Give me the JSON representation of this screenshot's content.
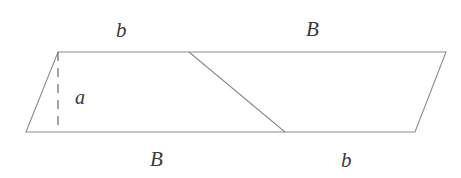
{
  "figure": {
    "type": "geometry-diagram",
    "background_color": "#ffffff",
    "stroke_color": "#8c8c8c",
    "dashed_stroke_color": "#7d7d7d",
    "label_color": "#3a3a3a",
    "canvas": {
      "width": 461,
      "height": 178
    },
    "shape": {
      "name": "parallelogram",
      "vertices": {
        "top_left": {
          "x": 58,
          "y": 52
        },
        "top_right": {
          "x": 446,
          "y": 52
        },
        "bottom_right": {
          "x": 415,
          "y": 132
        },
        "bottom_left": {
          "x": 26,
          "y": 132
        }
      },
      "points_attr": "58,52 446,52 415,132 26,132"
    },
    "diagonal": {
      "name": "interior-cut-line",
      "from": {
        "x": 189,
        "y": 52
      },
      "to": {
        "x": 285,
        "y": 132
      }
    },
    "height_segment": {
      "name": "dashed-height",
      "from": {
        "x": 58,
        "y": 52
      },
      "to": {
        "x": 58,
        "y": 132
      },
      "dash_pattern": "9 7"
    },
    "labels": {
      "top_left": "b",
      "top_right": "B",
      "height": "a",
      "bottom_left": "B",
      "bottom_right": "b"
    }
  }
}
